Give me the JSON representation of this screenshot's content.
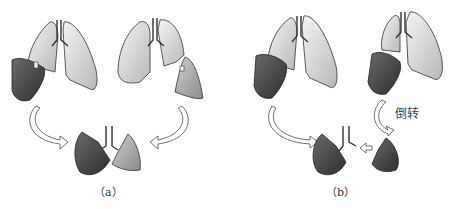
{
  "panels": [
    {
      "id": "a",
      "caption": "（a）"
    },
    {
      "id": "b",
      "caption": "（b）",
      "annotation": "倒转"
    }
  ],
  "colors": {
    "lung_light": "#e6e6e6",
    "lung_dark": "#4a4a4a",
    "lung_mid": "#a8a8a8",
    "outline": "#333333",
    "arrow": "#ffffff"
  }
}
